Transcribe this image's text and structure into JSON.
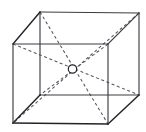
{
  "figure": {
    "description": "Line drawing of a cube in oblique parallel projection; four dashed space diagonals meet at a small open circle marking the body centre.",
    "background_color": "#ffffff",
    "solid_edge_color": "#3c3c44",
    "accent_edge_color": "#23232a",
    "dashed_line_color": "#55555e",
    "center_marker_label": "O",
    "center_marker": {
      "name": "body-centre",
      "cx": 72.5,
      "cy": 69.0,
      "r": 4.2,
      "fill": "#ffffff",
      "stroke": "#24242c"
    },
    "vertices": {
      "front_top_left": {
        "label": "A",
        "x": 13,
        "y": 44
      },
      "front_top_right": {
        "label": "B",
        "x": 108,
        "y": 44
      },
      "front_bottom_right": {
        "label": "C",
        "x": 108,
        "y": 124
      },
      "front_bottom_left": {
        "label": "D",
        "x": 13,
        "y": 123
      },
      "back_top_left": {
        "label": "E",
        "x": 40,
        "y": 12
      },
      "back_top_right": {
        "label": "F",
        "x": 139,
        "y": 13
      },
      "back_bottom_right": {
        "label": "G",
        "x": 139,
        "y": 95
      },
      "back_bottom_left": {
        "label": "H",
        "x": 40,
        "y": 95
      }
    },
    "edges_solid": [
      {
        "name": "front-top-edge",
        "from": "front_top_left",
        "to": "front_top_right"
      },
      {
        "name": "front-right-edge",
        "from": "front_top_right",
        "to": "front_bottom_right"
      },
      {
        "name": "front-bottom-edge",
        "from": "front_bottom_right",
        "to": "front_bottom_left"
      },
      {
        "name": "front-left-edge",
        "from": "front_bottom_left",
        "to": "front_top_left"
      },
      {
        "name": "back-top-edge",
        "from": "back_top_left",
        "to": "back_top_right"
      },
      {
        "name": "back-right-edge",
        "from": "back_top_right",
        "to": "back_bottom_right"
      },
      {
        "name": "back-bottom-edge",
        "from": "back_bottom_right",
        "to": "back_bottom_left"
      },
      {
        "name": "back-left-edge",
        "from": "back_bottom_left",
        "to": "back_top_left"
      },
      {
        "name": "connector-top-left",
        "from": "front_top_left",
        "to": "back_top_left"
      },
      {
        "name": "connector-top-right",
        "from": "front_top_right",
        "to": "back_top_right"
      },
      {
        "name": "connector-bottom-right",
        "from": "front_bottom_right",
        "to": "back_bottom_right"
      },
      {
        "name": "connector-bottom-left",
        "from": "front_bottom_left",
        "to": "back_bottom_left"
      }
    ],
    "diagonals_dashed": [
      {
        "name": "diagonal-back-top-left-to-front-bottom-right",
        "from": "back_top_left",
        "to": "front_bottom_right"
      },
      {
        "name": "diagonal-back-top-right-to-front-bottom-left",
        "from": "back_top_right",
        "to": "front_bottom_left"
      },
      {
        "name": "diagonal-front-top-left-to-back-bottom-right",
        "from": "front_top_left",
        "to": "back_bottom_right"
      },
      {
        "name": "diagonal-front-top-right-to-back-bottom-left",
        "from": "front_top_right",
        "to": "back_bottom_left"
      }
    ],
    "geometry_notes": {
      "projection": "oblique parallel",
      "depth_offset_x": 27,
      "depth_offset_y": -31,
      "front_face_width": 95,
      "front_face_height": 80
    }
  }
}
